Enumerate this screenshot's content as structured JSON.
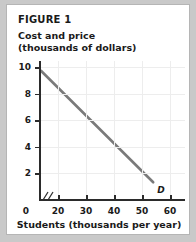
{
  "figure": {
    "label": "FIGURE 1"
  },
  "chart_data": {
    "type": "line",
    "title": "FIGURE 1",
    "ylabel_line1": "Cost and price",
    "ylabel_line2": "(thousands of dollars)",
    "xlabel": "Students (thousands per year)",
    "xlim": [
      0,
      65
    ],
    "ylim": [
      0,
      11
    ],
    "grid": true,
    "axis_break": true,
    "axis_break_symbol": "//",
    "legend_position": "inline-end-of-line",
    "x_ticks": [
      0,
      20,
      30,
      40,
      50,
      60
    ],
    "x_tick_labels": [
      "0",
      "20",
      "30",
      "40",
      "50",
      "60"
    ],
    "y_ticks": [
      2,
      4,
      6,
      8,
      10
    ],
    "y_tick_labels": [
      "2",
      "4",
      "6",
      "8",
      "10"
    ],
    "series": [
      {
        "name": "D",
        "annotation": "D",
        "color": "#7a7a7a",
        "x": [
          14,
          54
        ],
        "y": [
          9.7,
          1.3
        ],
        "points": [
          {
            "x": 14,
            "y": 9.7
          },
          {
            "x": 20,
            "y": 8.45
          },
          {
            "x": 30,
            "y": 6.35
          },
          {
            "x": 40,
            "y": 4.25
          },
          {
            "x": 50,
            "y": 2.15
          },
          {
            "x": 54,
            "y": 1.3
          }
        ]
      }
    ]
  },
  "colors": {
    "frame": "#c9c9c9",
    "card": "#ffffff",
    "axis": "#2b2b2b",
    "grid": "#ededed",
    "demand_line": "#7a7a7a",
    "text": "#1a1a1a"
  }
}
